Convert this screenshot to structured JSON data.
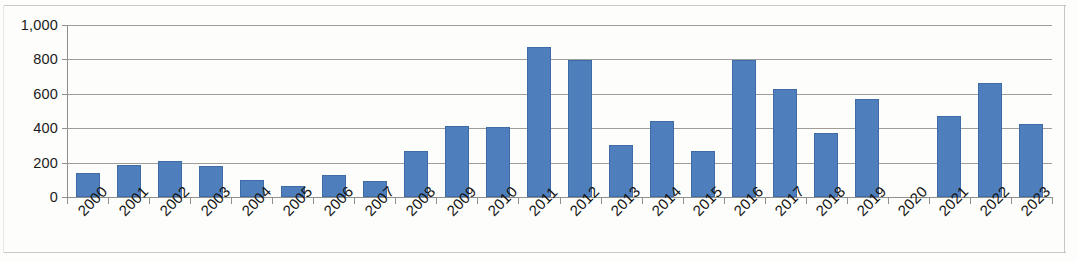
{
  "chart_data": {
    "type": "bar",
    "title": "",
    "subtitle": "",
    "xlabel": "",
    "ylabel": "",
    "categories": [
      "2000",
      "2001",
      "2002",
      "2003",
      "2004",
      "2005",
      "2006",
      "2007",
      "2008",
      "2009",
      "2010",
      "2011",
      "2012",
      "2013",
      "2014",
      "2015",
      "2016",
      "2017",
      "2018",
      "2019",
      "2020",
      "2021",
      "2022",
      "2023"
    ],
    "values": [
      140,
      185,
      210,
      180,
      100,
      65,
      130,
      95,
      265,
      412,
      405,
      870,
      795,
      305,
      440,
      265,
      795,
      630,
      370,
      570,
      0,
      470,
      660,
      425
    ],
    "series": [
      {
        "name": "",
        "values": [
          140,
          185,
          210,
          180,
          100,
          65,
          130,
          95,
          265,
          412,
          405,
          870,
          795,
          305,
          440,
          265,
          795,
          630,
          370,
          570,
          0,
          470,
          660,
          425
        ]
      }
    ],
    "ylim": [
      0,
      1000
    ],
    "y_ticks": [
      0,
      200,
      400,
      600,
      800,
      1000
    ],
    "y_tick_labels": [
      "0",
      "200",
      "400",
      "600",
      "800",
      "1,000"
    ],
    "grid": "horizontal",
    "legend": "none",
    "bar_color": "#4f7ebc",
    "bar_border_color": "#3f6ba6",
    "gridline_color": "#9d9d9a",
    "axis_color": "#8f8f8d",
    "background_color": "#fdfdfb",
    "x_label_rotation": -45
  }
}
